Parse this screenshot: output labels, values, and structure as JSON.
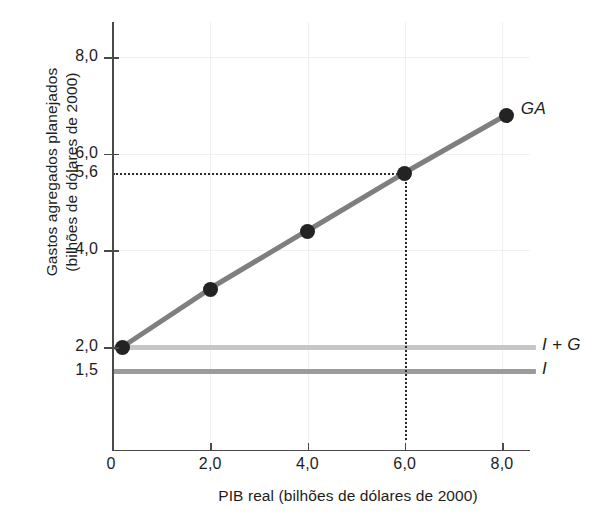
{
  "chart_data": {
    "type": "line",
    "title": "",
    "xlabel": "PIB real (bilhões de dólares de 2000)",
    "ylabel": "Gastos agregados planejados\n(bilhões de dólares de 2000)",
    "xlim": [
      -0.35,
      8.7
    ],
    "ylim": [
      0.07,
      8.9
    ],
    "grid": true,
    "legend_position": "right-of-line-end",
    "xticks": [
      {
        "value": 0,
        "label": "0"
      },
      {
        "value": 2,
        "label": "2,0"
      },
      {
        "value": 4,
        "label": "4,0"
      },
      {
        "value": 6,
        "label": "6,0"
      },
      {
        "value": 8,
        "label": "8,0"
      }
    ],
    "yticks": [
      {
        "value": 8.0,
        "label": "8,0",
        "tick": true
      },
      {
        "value": 6.0,
        "label": "6,0",
        "tick": true
      },
      {
        "value": 5.6,
        "label": "5,6",
        "tick": false
      },
      {
        "value": 4.0,
        "label": "4,0",
        "tick": true
      },
      {
        "value": 2.0,
        "label": "2,0",
        "tick": true
      },
      {
        "value": 1.5,
        "label": "1,5",
        "tick": false
      }
    ],
    "series": [
      {
        "name": "GA",
        "label": "GA",
        "type": "line-with-markers",
        "color": "#7f7f7f",
        "marker_color": "#232323",
        "points": [
          {
            "x": 0.2,
            "y": 2.0
          },
          {
            "x": 2.0,
            "y": 3.2
          },
          {
            "x": 4.0,
            "y": 4.4
          },
          {
            "x": 6.0,
            "y": 5.6
          },
          {
            "x": 8.1,
            "y": 6.8
          }
        ]
      },
      {
        "name": "I + G",
        "label": "I + G",
        "type": "horizontal-line",
        "color": "#c6c6c6",
        "y": 2.0,
        "x_start": 0.0,
        "x_end": 8.7
      },
      {
        "name": "I",
        "label": "I",
        "type": "horizontal-line",
        "color": "#9b9b9b",
        "y": 1.5,
        "x_start": 0.0,
        "x_end": 8.7
      }
    ],
    "annotations": [
      {
        "name": "equilibrium-guide-horizontal",
        "style": "dotted",
        "from": {
          "x": 0.0,
          "y": 5.6
        },
        "to": {
          "x": 6.0,
          "y": 5.6
        }
      },
      {
        "name": "equilibrium-guide-vertical",
        "style": "dotted",
        "from": {
          "x": 6.0,
          "y": 0.07
        },
        "to": {
          "x": 6.0,
          "y": 5.6
        }
      }
    ]
  },
  "axes": {
    "x_title": "PIB real (bilhões de dólares de 2000)",
    "y_title_line1": "Gastos agregados planejados",
    "y_title_line2": "(bilhões de dólares de 2000)"
  },
  "labels": {
    "ga": "GA",
    "i_plus_g": "I + G",
    "i": "I"
  },
  "colors": {
    "ga_line": "#7f7f7f",
    "marker": "#232323",
    "i_plus_g_line": "#c6c6c6",
    "i_line": "#9b9b9b",
    "axis": "#4a4a4a",
    "grid": "#f1f1f1",
    "dotted_guide": "#2a2a2a",
    "background": "#ffffff"
  }
}
